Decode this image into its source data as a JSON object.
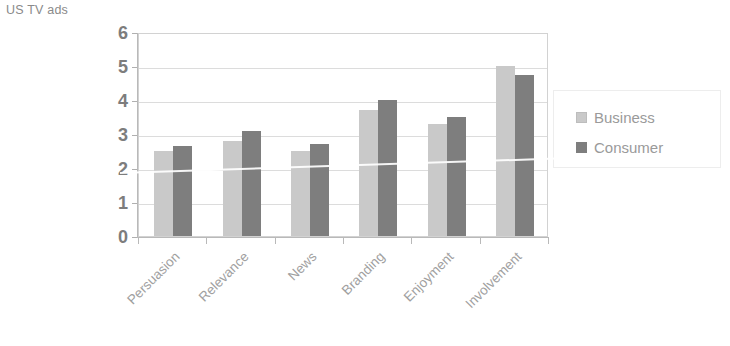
{
  "chart_data": {
    "type": "bar",
    "title": "US TV ads",
    "xlabel": "",
    "ylabel": "",
    "ylim": [
      0,
      6
    ],
    "ytick_step": 1,
    "yticks": [
      "0",
      "1",
      "2",
      "3",
      "4",
      "5",
      "6"
    ],
    "grid": true,
    "legend_position": "right",
    "categories": [
      "Persuasion",
      "Relevance",
      "News",
      "Branding",
      "Enjoyment",
      "Involvement"
    ],
    "series": [
      {
        "name": "Business",
        "color": "#c9c9c9",
        "values": [
          2.5,
          2.8,
          2.5,
          3.7,
          3.3,
          5.0
        ]
      },
      {
        "name": "Consumer",
        "color": "#7e7e7e",
        "values": [
          2.65,
          3.1,
          2.7,
          4.0,
          3.5,
          4.75
        ]
      }
    ]
  },
  "colors": {
    "business": "#c9c9c9",
    "consumer": "#7e7e7e",
    "axis": "#b9b9b9",
    "gridline": "#dcdcdc",
    "text": "#9a9a9a",
    "tick_text": "#7d7d7d"
  }
}
